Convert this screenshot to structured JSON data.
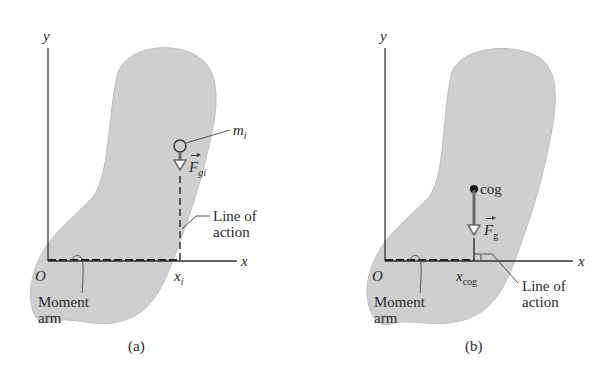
{
  "figure": {
    "colors": {
      "body_fill": "#cfcfcf",
      "body_stroke": "#bdbdbd",
      "axis": "#333333",
      "force_arrow": "#6a6a6a",
      "background": "#ffffff"
    },
    "panels": [
      {
        "id": "a",
        "caption": "(a)",
        "axis_y_label": "y",
        "axis_x_label": "x",
        "origin_label": "O",
        "position_label": {
          "base": "x",
          "sub": "i"
        },
        "mass_label": {
          "base": "m",
          "sub": "i"
        },
        "force_label": {
          "base": "F",
          "sub": "gi"
        },
        "line_of_action_label": [
          "Line of",
          "action"
        ],
        "moment_arm_label": [
          "Moment",
          "arm"
        ]
      },
      {
        "id": "b",
        "caption": "(b)",
        "axis_y_label": "y",
        "axis_x_label": "x",
        "origin_label": "O",
        "position_label": {
          "base": "x",
          "sub": "cog"
        },
        "point_label": "cog",
        "force_label": {
          "base": "F",
          "sub": "g"
        },
        "line_of_action_label": [
          "Line of",
          "action"
        ],
        "moment_arm_label": [
          "Moment",
          "arm"
        ]
      }
    ]
  }
}
